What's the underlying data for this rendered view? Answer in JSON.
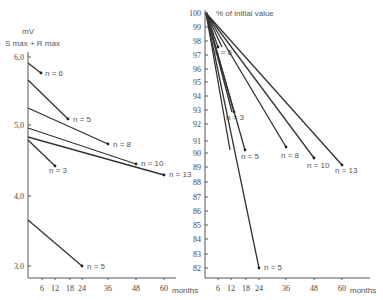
{
  "chart_data": [
    {
      "type": "line",
      "title": "",
      "ylabel": "mV  S max + R max",
      "xlabel": "months",
      "yticks": [
        "6,0",
        "5,0",
        "4,0",
        "3,0"
      ],
      "xticks": [
        "6",
        "12",
        "18",
        "24",
        "36",
        "48",
        "60"
      ],
      "ylim": [
        2.8,
        6.1
      ],
      "xlim": [
        0,
        66
      ],
      "grid": false,
      "series": [
        {
          "name": "n = 6",
          "x": [
            0,
            12
          ],
          "y": [
            5.88,
            5.71
          ]
        },
        {
          "name": "n = 5",
          "x": [
            0,
            18
          ],
          "y": [
            5.62,
            5.07
          ]
        },
        {
          "name": "n = 8",
          "x": [
            0,
            36
          ],
          "y": [
            5.22,
            4.73
          ]
        },
        {
          "name": "n = 10",
          "x": [
            0,
            48
          ],
          "y": [
            4.93,
            4.45
          ]
        },
        {
          "name": "n = 13",
          "x": [
            0,
            60
          ],
          "y": [
            4.82,
            4.3
          ]
        },
        {
          "name": "n = 3",
          "x": [
            0,
            12
          ],
          "y": [
            4.78,
            4.4
          ]
        },
        {
          "name": "n = 5",
          "x": [
            0,
            24
          ],
          "y": [
            3.66,
            3.0
          ]
        }
      ]
    },
    {
      "type": "line",
      "title": "% of initial value",
      "ylabel": "% of initial value",
      "xlabel": "months",
      "yticks": [
        "100",
        "99",
        "98",
        "97",
        "96",
        "95",
        "94",
        "93",
        "92",
        "91",
        "90",
        "89",
        "88",
        "87",
        "86",
        "85",
        "84",
        "83",
        "82"
      ],
      "xticks": [
        "6",
        "12",
        "18",
        "24",
        "36",
        "48",
        "60"
      ],
      "ylim": [
        81.5,
        100
      ],
      "xlim": [
        0,
        66
      ],
      "grid": false,
      "series": [
        {
          "name": "n = 6",
          "x": [
            0,
            12
          ],
          "y": [
            100,
            97.1
          ]
        },
        {
          "name": "n = 3",
          "x": [
            0,
            12
          ],
          "y": [
            100,
            92.6
          ]
        },
        {
          "name": "n = 5",
          "x": [
            0,
            18
          ],
          "y": [
            100,
            90.2
          ]
        },
        {
          "name": "n = 8",
          "x": [
            0,
            36
          ],
          "y": [
            100,
            90.4
          ]
        },
        {
          "name": "n = 10",
          "x": [
            0,
            48
          ],
          "y": [
            100,
            89.6
          ]
        },
        {
          "name": "n = 13",
          "x": [
            0,
            60
          ],
          "y": [
            100,
            89.1
          ]
        },
        {
          "name": "n = 5",
          "x": [
            0,
            24
          ],
          "y": [
            100,
            81.8
          ]
        }
      ]
    }
  ],
  "left": {
    "unit_label": "mV",
    "ylabel": "S max + R max",
    "xlabel": "months",
    "yticks": [
      {
        "label": "6,0",
        "y": 57
      },
      {
        "label": "5,0",
        "y": 125
      },
      {
        "label": "4,0",
        "y": 196
      },
      {
        "label": "3,0",
        "y": 266
      }
    ],
    "xticks": [
      {
        "label": "6",
        "x": 42
      },
      {
        "label": "12",
        "x": 55
      },
      {
        "label": "18",
        "x": 70
      },
      {
        "label": "24",
        "x": 82
      },
      {
        "label": "36",
        "x": 108
      },
      {
        "label": "48",
        "x": 136
      },
      {
        "label": "60",
        "x": 164
      }
    ],
    "lines": [
      {
        "label": "n = 6",
        "x1": 28,
        "y1": 63,
        "x2": 41,
        "y2": 73,
        "lx": 45,
        "ly": 76
      },
      {
        "label": "n = 5",
        "x1": 28,
        "y1": 80,
        "x2": 68,
        "y2": 119,
        "lx": 73,
        "ly": 122
      },
      {
        "label": "n = 8",
        "x1": 28,
        "y1": 108,
        "x2": 108,
        "y2": 144,
        "lx": 113,
        "ly": 147
      },
      {
        "label": "n = 10",
        "x1": 28,
        "y1": 128,
        "x2": 136,
        "y2": 164,
        "lx": 141,
        "ly": 166
      },
      {
        "label": "n = 13",
        "x1": 28,
        "y1": 137,
        "x2": 164,
        "y2": 175,
        "lx": 169,
        "ly": 177
      },
      {
        "label": "n = 3",
        "x1": 28,
        "y1": 140,
        "x2": 55,
        "y2": 166,
        "lx": 49,
        "ly": 173
      },
      {
        "label": "n = 5",
        "x1": 28,
        "y1": 220,
        "x2": 82,
        "y2": 266,
        "lx": 87,
        "ly": 269
      }
    ]
  },
  "right": {
    "title": "% of initial value",
    "xlabel": "months",
    "yticks": [
      {
        "label": "100",
        "y": 13
      },
      {
        "label": "99",
        "y": 27
      },
      {
        "label": "98",
        "y": 41
      },
      {
        "label": "97",
        "y": 55
      },
      {
        "label": "96",
        "y": 69
      },
      {
        "label": "95",
        "y": 82
      },
      {
        "label": "94",
        "y": 96
      },
      {
        "label": "93",
        "y": 110
      },
      {
        "label": "92",
        "y": 124
      },
      {
        "label": "91",
        "y": 141
      },
      {
        "label": "90",
        "y": 153
      },
      {
        "label": "89",
        "y": 167
      },
      {
        "label": "88",
        "y": 182
      },
      {
        "label": "87",
        "y": 197
      },
      {
        "label": "86",
        "y": 211
      },
      {
        "label": "85",
        "y": 225
      },
      {
        "label": "84",
        "y": 239
      },
      {
        "label": "83",
        "y": 254
      },
      {
        "label": "82",
        "y": 268
      }
    ],
    "xticks": [
      {
        "label": "6",
        "x": 218
      },
      {
        "label": "12",
        "x": 231
      },
      {
        "label": "18",
        "x": 246
      },
      {
        "label": "24",
        "x": 259
      },
      {
        "label": "36",
        "x": 286
      },
      {
        "label": "48",
        "x": 314
      },
      {
        "label": "60",
        "x": 342
      }
    ],
    "lines": [
      {
        "label": "n = 6",
        "x1": 206,
        "y1": 13,
        "x2": 218,
        "y2": 47,
        "lx": 214,
        "ly": 55
      },
      {
        "label": "n = 3",
        "x1": 206,
        "y1": 13,
        "x2": 234,
        "y2": 112,
        "lx": 226,
        "ly": 120
      },
      {
        "label": "n = 5",
        "x1": 206,
        "y1": 13,
        "x2": 245,
        "y2": 150,
        "lx": 241,
        "ly": 159
      },
      {
        "label": "n = 8",
        "x1": 206,
        "y1": 13,
        "x2": 286,
        "y2": 147,
        "lx": 281,
        "ly": 158
      },
      {
        "label": "n = 10",
        "x1": 206,
        "y1": 13,
        "x2": 314,
        "y2": 158,
        "lx": 307,
        "ly": 168
      },
      {
        "label": "n = 13",
        "x1": 206,
        "y1": 13,
        "x2": 342,
        "y2": 165,
        "lx": 335,
        "ly": 173
      },
      {
        "label": "n = 5",
        "x1": 206,
        "y1": 13,
        "x2": 259,
        "y2": 268,
        "lx": 264,
        "ly": 270
      }
    ],
    "inner_lines": [
      {
        "x1": 206,
        "y1": 13,
        "x2": 232,
        "y2": 112
      },
      {
        "x1": 206,
        "y1": 13,
        "x2": 230,
        "y2": 150
      },
      {
        "x1": 206,
        "y1": 13,
        "x2": 222,
        "y2": 47
      }
    ]
  }
}
